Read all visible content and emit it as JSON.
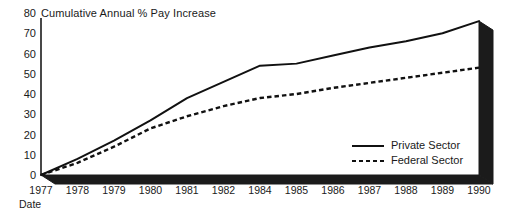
{
  "chart_data": {
    "type": "line",
    "title": "Cumulative Annual % Pay Increase",
    "xlabel": "Date",
    "ylabel": "",
    "categories": [
      "1977",
      "1978",
      "1979",
      "1980",
      "1981",
      "1982",
      "1984",
      "1985",
      "1986",
      "1987",
      "1988",
      "1989",
      "1990"
    ],
    "xtick_labels": [
      "1977",
      "1978",
      "1979",
      "1980",
      "1981",
      "1982",
      "1984",
      "1985",
      "1986",
      "1987",
      "1988",
      "1989",
      "1990"
    ],
    "ytick_labels": [
      "0",
      "10",
      "20",
      "30",
      "40",
      "50",
      "60",
      "70",
      "80"
    ],
    "yticks": [
      0,
      10,
      20,
      30,
      40,
      50,
      60,
      70,
      80
    ],
    "ylim": [
      0,
      80
    ],
    "grid": false,
    "legend_position": "inside-bottom-right",
    "series": [
      {
        "name": "Private Sector",
        "style": "solid",
        "color": "#111111",
        "values": [
          0,
          8,
          17,
          27,
          38,
          46,
          54,
          55,
          59,
          63,
          66,
          70,
          76
        ]
      },
      {
        "name": "Federal Sector",
        "style": "dashed",
        "color": "#111111",
        "values": [
          0,
          6,
          14,
          23,
          29,
          34,
          38,
          40,
          43,
          45.5,
          48,
          50.5,
          53
        ]
      }
    ]
  },
  "legend": {
    "items": [
      {
        "label": "Private Sector",
        "style": "solid"
      },
      {
        "label": "Federal Sector",
        "style": "dashed"
      }
    ]
  }
}
